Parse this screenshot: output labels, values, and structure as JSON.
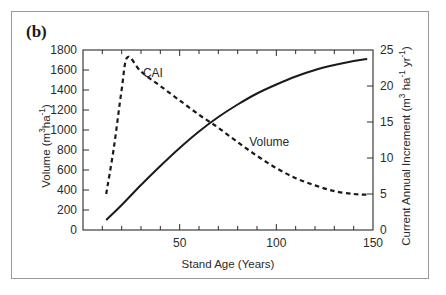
{
  "panel": {
    "label": "(b)"
  },
  "chart_data": {
    "type": "line",
    "title": "",
    "subtitle": "",
    "panel_label": "(b)",
    "xlabel": "Stand Age (Years)",
    "ylabel": "Volume (m3ha-1)",
    "ylabel_right": "Current Annual Increment (m3 ha-1 yr-1)",
    "xlim": [
      0,
      150
    ],
    "ylim": [
      0,
      1800
    ],
    "ylim_right": [
      0,
      25
    ],
    "xticks": [
      0,
      10,
      20,
      30,
      40,
      50,
      60,
      70,
      80,
      90,
      100,
      110,
      120,
      130,
      140,
      150
    ],
    "xtick_labels": [
      "",
      "",
      "",
      "",
      "",
      "50",
      "",
      "",
      "",
      "",
      "100",
      "",
      "",
      "",
      "",
      "150"
    ],
    "yticks": [
      0,
      200,
      400,
      600,
      800,
      1000,
      1200,
      1400,
      1600,
      1800
    ],
    "ytick_labels": [
      "0",
      "200",
      "400",
      "600",
      "800",
      "1000",
      "1200",
      "1400",
      "1600",
      "1800"
    ],
    "yticks_right": [
      0,
      5,
      10,
      15,
      20,
      25
    ],
    "ytick_labels_right": [
      "0",
      "5",
      "10",
      "15",
      "20",
      "25"
    ],
    "grid": false,
    "legend": "inline-annotations",
    "series": [
      {
        "name": "Volume",
        "axis": "left",
        "style": "solid",
        "color": "#1a1a1a",
        "x": [
          12,
          20,
          30,
          40,
          50,
          60,
          70,
          80,
          90,
          100,
          110,
          120,
          130,
          140,
          147
        ],
        "values": [
          100,
          250,
          450,
          640,
          820,
          985,
          1130,
          1255,
          1365,
          1455,
          1535,
          1600,
          1650,
          1690,
          1710
        ]
      },
      {
        "name": "CAI",
        "axis": "right",
        "style": "dashed",
        "color": "#1a1a1a",
        "x": [
          12,
          16,
          20,
          23,
          30,
          40,
          50,
          60,
          65,
          70,
          80,
          90,
          100,
          110,
          120,
          130,
          140,
          147
        ],
        "values": [
          5.0,
          11.5,
          19.5,
          24.0,
          22.0,
          20.0,
          18.0,
          16.0,
          15.1,
          14.2,
          12.2,
          10.3,
          8.6,
          7.2,
          6.2,
          5.4,
          5.0,
          4.9
        ]
      }
    ],
    "annotations": [
      {
        "text": "CAI",
        "x": 31,
        "y_right": 21.2
      },
      {
        "text": "Volume",
        "x": 86,
        "y_right": 11.6
      }
    ]
  },
  "axes": {
    "x_title": "Stand Age (Years)",
    "y_left_title_main": "Volume (m",
    "y_left_title_sup1": "3",
    "y_left_title_mid": "ha",
    "y_left_title_sup2": "-1",
    "y_left_title_end": ")",
    "y_right_title_main": "Current Annual Increment (m",
    "y_right_title_sup1": "3",
    "y_right_title_mid": " ha",
    "y_right_title_sup2": "-1",
    "y_right_title_mid2": " yr",
    "y_right_title_sup3": "-1",
    "y_right_title_end": ")"
  },
  "colors": {
    "frame": "#9a9a9a",
    "axis": "#2b2b2b",
    "series": "#1a1a1a",
    "text": "#2b2b2b",
    "background": "#ffffff"
  }
}
